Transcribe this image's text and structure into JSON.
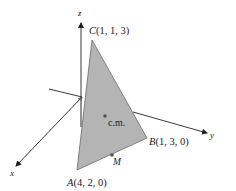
{
  "diagram": {
    "type": "3d-coordinate-triangle",
    "axes": {
      "x": {
        "label": "x"
      },
      "y": {
        "label": "y"
      },
      "z": {
        "label": "z"
      }
    },
    "vertices": [
      {
        "name": "A",
        "coords": "(4, 2, 0)"
      },
      {
        "name": "B",
        "coords": "(1, 3, 0)"
      },
      {
        "name": "C",
        "coords": "(1, 1, 3)"
      }
    ],
    "points": [
      {
        "label": "c.m."
      },
      {
        "label": "M"
      }
    ],
    "colors": {
      "triangle_fill": "#b4b4b4",
      "triangle_stroke": "#6a6a6a",
      "axis": "#222222",
      "point": "#555555"
    }
  }
}
